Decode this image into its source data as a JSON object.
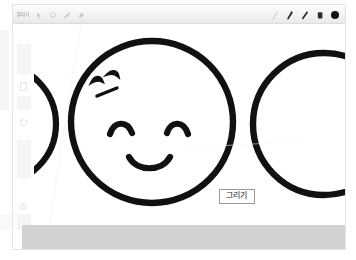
{
  "app": {
    "title": "Drawing canvas",
    "language": "ko"
  },
  "toolbar": {
    "mode_label": "말하기",
    "left_icons": [
      {
        "name": "cursor-icon",
        "label": "Select"
      },
      {
        "name": "lasso-icon",
        "label": "Lasso select"
      },
      {
        "name": "pen-small-icon",
        "label": "Pen"
      },
      {
        "name": "eraser-small-icon",
        "label": "Eraser"
      }
    ],
    "right_tools": [
      {
        "name": "ruler-icon",
        "label": "Ruler",
        "active": false
      },
      {
        "name": "pen-icon",
        "label": "Pen",
        "active": true
      },
      {
        "name": "marker-icon",
        "label": "Marker",
        "active": true
      },
      {
        "name": "eraser-icon",
        "label": "Eraser",
        "active": true
      }
    ],
    "color_swatch": {
      "name": "color-swatch",
      "label": "Color",
      "color": "#111111"
    }
  },
  "sidebar": {
    "items": [
      {
        "label": "Page thumbnail 1"
      },
      {
        "label": "Page thumbnail 2"
      },
      {
        "label": "Page thumbnail 3"
      },
      {
        "label": "Page thumbnail 4"
      }
    ]
  },
  "canvas": {
    "callout_label": "그리기",
    "stroke_color": "#111111",
    "background": "#ffffff",
    "shapes": [
      {
        "name": "circle-left-partial",
        "label": "Partial circle (left edge)"
      },
      {
        "name": "circle-center-face",
        "label": "Smiley face circle"
      },
      {
        "name": "circle-right-partial",
        "label": "Partial circle (right edge)"
      }
    ],
    "face": {
      "left_eye": "closed curved eye",
      "right_eye": "closed curved eye",
      "mouth": "smiling curve",
      "eyebrow_marks": "three short strokes upper-left"
    }
  },
  "status_bar": {
    "color": "#d2d2d2"
  }
}
